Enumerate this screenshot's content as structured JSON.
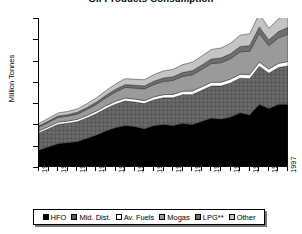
{
  "chart_data": {
    "type": "area",
    "title": "Oil Products Consumption",
    "subtitle": "",
    "xlabel": "",
    "ylabel": "Million Tonnes",
    "ylim": [
      0,
      7
    ],
    "y_ticks": [
      0,
      1,
      2,
      3,
      4,
      5,
      6,
      7
    ],
    "grid": false,
    "stacked": true,
    "legend_position": "bottom",
    "x": [
      1971,
      1972,
      1973,
      1974,
      1975,
      1976,
      1977,
      1978,
      1979,
      1980,
      1981,
      1982,
      1983,
      1984,
      1985,
      1986,
      1987,
      1988,
      1989,
      1990,
      1991,
      1992,
      1993,
      1994,
      1995,
      1996,
      1997
    ],
    "x_tick_labels": [
      "1971",
      "1973",
      "1975",
      "1977",
      "1979",
      "1981",
      "1983",
      "1985",
      "1987",
      "1989",
      "1991",
      "1993",
      "1995",
      "1997"
    ],
    "series": [
      {
        "name": "HFO",
        "color": "#000000",
        "pattern": "solid",
        "values": [
          0.8,
          0.95,
          1.1,
          1.15,
          1.2,
          1.35,
          1.5,
          1.7,
          1.85,
          1.95,
          1.9,
          1.8,
          1.95,
          2.0,
          1.95,
          2.05,
          2.0,
          2.15,
          2.3,
          2.25,
          2.35,
          2.55,
          2.45,
          2.95,
          2.75,
          2.95,
          2.95
        ]
      },
      {
        "name": "Mid. Dist.",
        "color": "#585858",
        "pattern": "crosshatch",
        "values": [
          0.8,
          0.85,
          0.9,
          0.9,
          0.92,
          0.95,
          1.0,
          1.05,
          1.1,
          1.15,
          1.15,
          1.18,
          1.2,
          1.25,
          1.3,
          1.35,
          1.4,
          1.45,
          1.5,
          1.55,
          1.6,
          1.62,
          1.7,
          1.78,
          1.65,
          1.72,
          1.8
        ]
      },
      {
        "name": "Av. Fuels",
        "color": "#ffffff",
        "pattern": "solid",
        "values": [
          0.1,
          0.1,
          0.11,
          0.11,
          0.12,
          0.12,
          0.13,
          0.13,
          0.14,
          0.14,
          0.14,
          0.14,
          0.15,
          0.15,
          0.16,
          0.16,
          0.17,
          0.17,
          0.18,
          0.18,
          0.18,
          0.19,
          0.19,
          0.2,
          0.2,
          0.2,
          0.21
        ]
      },
      {
        "name": "Mogas",
        "color": "#9a9a9a",
        "pattern": "solid",
        "values": [
          0.18,
          0.2,
          0.22,
          0.23,
          0.25,
          0.28,
          0.32,
          0.38,
          0.44,
          0.5,
          0.52,
          0.55,
          0.58,
          0.62,
          0.66,
          0.7,
          0.76,
          0.82,
          0.88,
          0.92,
          0.96,
          1.05,
          1.1,
          1.35,
          1.1,
          1.2,
          1.28
        ]
      },
      {
        "name": "LPG**",
        "color": "#6f6f6f",
        "pattern": "solid",
        "values": [
          0.05,
          0.06,
          0.07,
          0.07,
          0.08,
          0.09,
          0.1,
          0.11,
          0.12,
          0.13,
          0.13,
          0.14,
          0.15,
          0.16,
          0.17,
          0.18,
          0.19,
          0.2,
          0.21,
          0.22,
          0.23,
          0.25,
          0.26,
          0.3,
          0.27,
          0.29,
          0.31
        ]
      },
      {
        "name": "Other",
        "color": "#c4c4c4",
        "pattern": "solid",
        "values": [
          0.12,
          0.13,
          0.14,
          0.15,
          0.16,
          0.18,
          0.2,
          0.22,
          0.25,
          0.28,
          0.28,
          0.29,
          0.31,
          0.33,
          0.35,
          0.37,
          0.4,
          0.42,
          0.45,
          0.47,
          0.49,
          0.53,
          0.56,
          0.62,
          0.55,
          0.6,
          0.65
        ]
      }
    ],
    "totals": [
      2.05,
      2.29,
      2.54,
      2.61,
      2.73,
      2.97,
      3.25,
      3.59,
      3.9,
      4.15,
      4.12,
      4.1,
      4.34,
      4.51,
      4.59,
      4.81,
      4.92,
      5.21,
      5.52,
      5.59,
      5.81,
      6.19,
      6.26,
      7.2,
      6.52,
      6.96,
      7.2
    ]
  },
  "legend": {
    "items": [
      {
        "label": "HFO",
        "swatch": "#000000"
      },
      {
        "label": "Mid. Dist.",
        "swatch": "#585858"
      },
      {
        "label": "Av. Fuels",
        "swatch": "#ffffff"
      },
      {
        "label": "Mogas",
        "swatch": "#9a9a9a"
      },
      {
        "label": "LPG**",
        "swatch": "#6f6f6f"
      },
      {
        "label": "Other",
        "swatch": "#c4c4c4"
      }
    ]
  }
}
